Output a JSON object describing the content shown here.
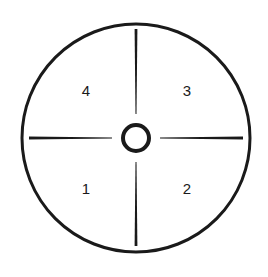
{
  "diagram": {
    "type": "quadrant-dial",
    "colors": {
      "stroke": "#1a1a1a",
      "background": "#ffffff"
    },
    "outer_circle": {
      "cx": 136,
      "cy": 138,
      "r": 114
    },
    "center_ring": {
      "cx": 136,
      "cy": 138,
      "r": 13,
      "stroke_width": 4
    },
    "quadrants": [
      {
        "id": "quadrant-1",
        "label": "1",
        "x": 86,
        "y": 194,
        "position": "bottom-left"
      },
      {
        "id": "quadrant-2",
        "label": "2",
        "x": 187,
        "y": 194,
        "position": "bottom-right"
      },
      {
        "id": "quadrant-3",
        "label": "3",
        "x": 187,
        "y": 96,
        "position": "top-right"
      },
      {
        "id": "quadrant-4",
        "label": "4",
        "x": 86,
        "y": 96,
        "position": "top-left"
      }
    ]
  }
}
